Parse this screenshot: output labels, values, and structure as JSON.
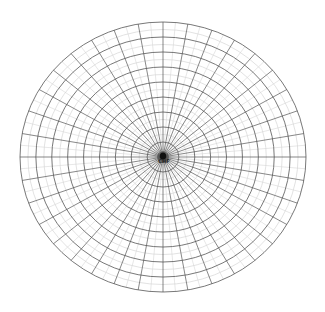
{
  "diagram": {
    "type": "polar-grid",
    "center_label": "CHF",
    "center": {
      "x": 163,
      "y": 157
    },
    "radius": {
      "x": 143,
      "y": 135
    },
    "major_rings": 9,
    "minor_rings_per_major": 1,
    "major_spoke_step_deg": 10,
    "minor_spoke_step_deg": 5,
    "colors": {
      "background": "#ffffff",
      "major_line": "#555555",
      "minor_line": "#d6d6d6",
      "center_cluster": "#111111"
    }
  }
}
